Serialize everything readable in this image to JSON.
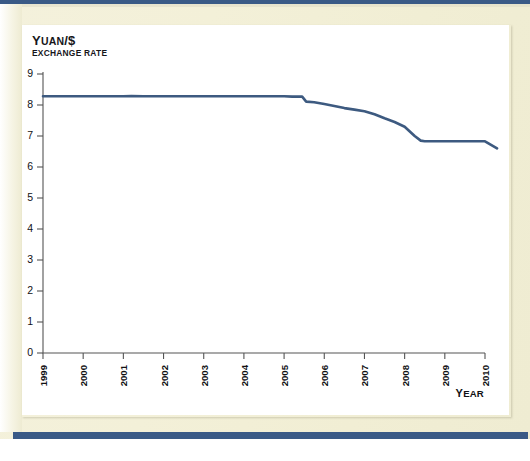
{
  "figure": {
    "title_main": "Y",
    "title_rest": "UAN",
    "title_tail": "/$",
    "title_full": "Yuan/$",
    "subtitle": "EXCHANGE RATE",
    "axis_name_x_cap": "Y",
    "axis_name_x_rest": "EAR",
    "axis_name_x_full": "YEAR"
  },
  "colors": {
    "line": "#3d5a80",
    "paper": "#f2efd8",
    "rule": "#3a5a86",
    "axis": "#555555",
    "card": "#ffffff"
  },
  "chart_data": {
    "type": "line",
    "title": "Yuan/$",
    "subtitle": "EXCHANGE RATE",
    "xlabel": "Year",
    "ylabel": "Yuan/$",
    "xlim": [
      1999,
      2010
    ],
    "ylim": [
      0,
      9
    ],
    "grid": false,
    "legend": false,
    "ytick_labels": [
      "0",
      "1",
      "2",
      "3",
      "4",
      "5",
      "6",
      "7",
      "8",
      "9"
    ],
    "ytick_values": [
      0,
      1,
      2,
      3,
      4,
      5,
      6,
      7,
      8,
      9
    ],
    "xtick_labels": [
      "1999",
      "2000",
      "2001",
      "2002",
      "2003",
      "2004",
      "2005",
      "2006",
      "2007",
      "2008",
      "2009",
      "2010"
    ],
    "xtick_values": [
      1999,
      2000,
      2001,
      2002,
      2003,
      2004,
      2005,
      2006,
      2007,
      2008,
      2009,
      2010
    ],
    "series": [
      {
        "name": "Yuan per US dollar",
        "color": "#3d5a80",
        "x": [
          1999.0,
          1999.5,
          2000.0,
          2000.5,
          2001.0,
          2001.2,
          2001.5,
          2002.0,
          2002.5,
          2003.0,
          2003.5,
          2004.0,
          2004.5,
          2005.0,
          2005.2,
          2005.45,
          2005.55,
          2005.75,
          2006.0,
          2006.25,
          2006.5,
          2006.75,
          2007.0,
          2007.25,
          2007.5,
          2007.75,
          2008.0,
          2008.25,
          2008.4,
          2008.5,
          2008.75,
          2009.0,
          2009.25,
          2009.5,
          2009.75,
          2010.0,
          2010.3
        ],
        "y": [
          8.28,
          8.28,
          8.28,
          8.28,
          8.28,
          8.29,
          8.28,
          8.28,
          8.28,
          8.28,
          8.28,
          8.28,
          8.28,
          8.28,
          8.27,
          8.27,
          8.11,
          8.09,
          8.03,
          7.97,
          7.9,
          7.85,
          7.8,
          7.7,
          7.57,
          7.45,
          7.3,
          7.0,
          6.85,
          6.83,
          6.83,
          6.83,
          6.83,
          6.83,
          6.83,
          6.83,
          6.6
        ]
      }
    ]
  }
}
